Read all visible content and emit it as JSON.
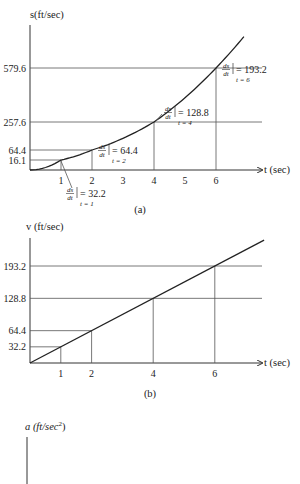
{
  "chart_data": [
    {
      "id": "a",
      "type": "line",
      "caption": "(a)",
      "ylabel": "s(ft/sec)",
      "xlabel": "t (sec)",
      "x_ticks": [
        "1",
        "2",
        "3",
        "4",
        "5",
        "6"
      ],
      "y_ticks": [
        "16.1",
        "64.4",
        "257.6",
        "579.6"
      ],
      "series": [
        {
          "name": "s = 16.1 t^2",
          "x": [
            0,
            1,
            2,
            4,
            6
          ],
          "y": [
            0,
            16.1,
            64.4,
            257.6,
            579.6
          ]
        }
      ],
      "highlighted_points": [
        {
          "t": 1,
          "s": 16.1
        },
        {
          "t": 2,
          "s": 64.4
        },
        {
          "t": 4,
          "s": 257.6
        },
        {
          "t": 6,
          "s": 579.6
        }
      ],
      "annotations": [
        {
          "deriv": "ds/dt",
          "value": "= 32.2",
          "at": "t = 1"
        },
        {
          "deriv": "ds/dt",
          "value": "= 64.4",
          "at": "t = 2"
        },
        {
          "deriv": "ds/dt",
          "value": "= 128.8",
          "at": "t = 4"
        },
        {
          "deriv": "ds/dt",
          "value": "= 193.2",
          "at": "t = 6"
        }
      ]
    },
    {
      "id": "b",
      "type": "line",
      "caption": "(b)",
      "ylabel": "v (ft/sec)",
      "xlabel": "t (sec)",
      "x_ticks": [
        "1",
        "2",
        "4",
        "6"
      ],
      "y_ticks": [
        "32.2",
        "64.4",
        "128.8",
        "193.2"
      ],
      "series": [
        {
          "name": "v = 32.2 t",
          "x": [
            0,
            1,
            2,
            4,
            6
          ],
          "y": [
            0,
            32.2,
            64.4,
            128.8,
            193.2
          ]
        }
      ]
    },
    {
      "id": "c",
      "type": "line",
      "caption": "",
      "ylabel": "a (ft/sec²)",
      "ylabel_main": "a (ft/sec",
      "ylabel_sup": "2",
      "ylabel_tail": ")"
    }
  ]
}
